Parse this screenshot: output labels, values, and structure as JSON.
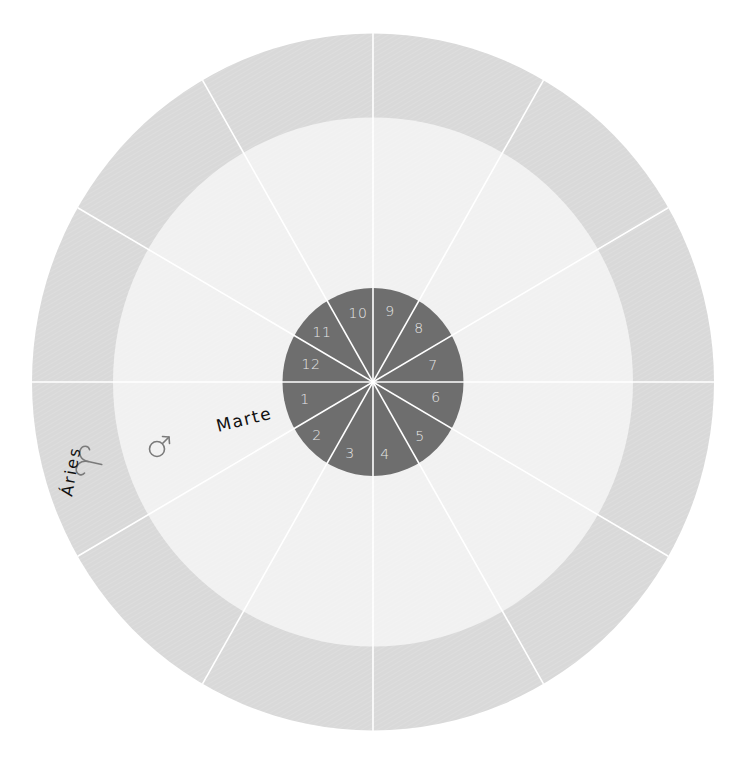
{
  "chart": {
    "center": {
      "x": 373,
      "y": 382
    },
    "outer_ring": {
      "rx": 341,
      "ry": 348.5,
      "color": "#d9d9d9"
    },
    "inner_ring": {
      "rx": 260,
      "ry": 264.5,
      "color": "#f1f1f1"
    },
    "center_disk": {
      "rx": 90.5,
      "ry": 94,
      "color": "#6e6e6e"
    },
    "spoke_color": "#ffffff",
    "spoke_angle_step_deg": 30
  },
  "houses": [
    {
      "number": "1",
      "x": 305,
      "y": 399
    },
    {
      "number": "2",
      "x": 317,
      "y": 435
    },
    {
      "number": "3",
      "x": 350,
      "y": 453
    },
    {
      "number": "4",
      "x": 385,
      "y": 454
    },
    {
      "number": "5",
      "x": 420,
      "y": 436
    },
    {
      "number": "6",
      "x": 436,
      "y": 397
    },
    {
      "number": "7",
      "x": 433,
      "y": 365
    },
    {
      "number": "8",
      "x": 419,
      "y": 328
    },
    {
      "number": "9",
      "x": 390,
      "y": 311
    },
    {
      "number": "10",
      "x": 358,
      "y": 313
    },
    {
      "number": "11",
      "x": 322,
      "y": 332
    },
    {
      "number": "12",
      "x": 311,
      "y": 364
    }
  ],
  "planet": {
    "name": "Marte",
    "symbol": "mars-symbol",
    "label_color": "#111111",
    "glyph_color": "#7a7a7a"
  },
  "sign": {
    "name": "Áries",
    "symbol": "aries-symbol",
    "label_color": "#111111",
    "glyph_color": "#7a7a7a"
  }
}
